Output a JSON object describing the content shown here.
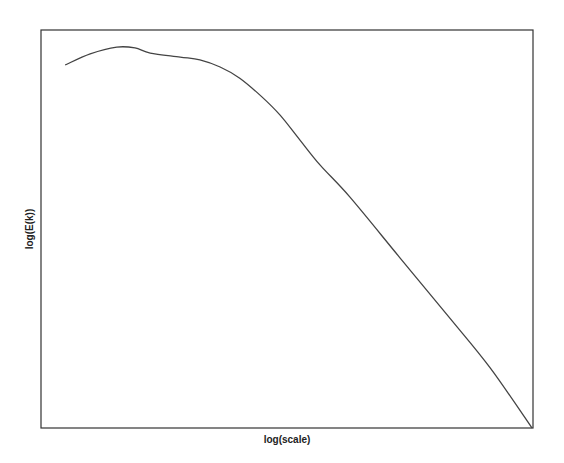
{
  "chart_data": {
    "type": "line",
    "title": "",
    "xlabel": "log(scale)",
    "ylabel": "log(E(k))",
    "xlim": [
      0,
      1
    ],
    "ylim": [
      0,
      1
    ],
    "grid": false,
    "ticks": false,
    "legend": "none",
    "series": [
      {
        "name": "E(k)",
        "color": "#444444",
        "x": [
          0.049,
          0.1,
          0.154,
          0.191,
          0.222,
          0.283,
          0.323,
          0.364,
          0.404,
          0.449,
          0.486,
          0.526,
          0.567,
          0.628,
          0.73,
          0.831,
          0.913,
          0.998
        ],
        "y": [
          0.912,
          0.94,
          0.957,
          0.955,
          0.942,
          0.932,
          0.925,
          0.907,
          0.879,
          0.832,
          0.786,
          0.724,
          0.661,
          0.58,
          0.427,
          0.276,
          0.151,
          0.0
        ]
      }
    ]
  }
}
